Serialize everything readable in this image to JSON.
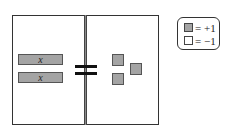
{
  "diagram": {
    "left_side": {
      "tiles": [
        {
          "type": "x-tile",
          "label": "x"
        },
        {
          "type": "x-tile",
          "label": "x"
        }
      ]
    },
    "relation": "=",
    "right_side": {
      "tiles": [
        {
          "type": "unit-tile",
          "value": "+1"
        },
        {
          "type": "unit-tile",
          "value": "+1"
        },
        {
          "type": "unit-tile",
          "value": "+1"
        }
      ]
    }
  },
  "legend": {
    "items": [
      {
        "swatch": "shaded",
        "color": "#a4a4a4",
        "label": "= +1"
      },
      {
        "swatch": "white",
        "color": "#ffffff",
        "label": "= −1"
      }
    ]
  },
  "colors": {
    "tile_fill": "#a4a4a4",
    "border": "#333333"
  }
}
